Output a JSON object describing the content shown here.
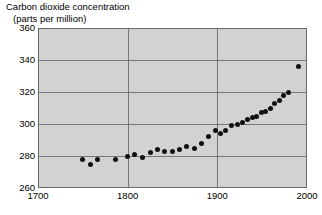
{
  "chart_data": {
    "type": "scatter",
    "title": "Carbon dioxide concentration (parts per million)",
    "title_line1": "Carbon dioxide concentration",
    "title_line2": "(parts per million)",
    "xlabel": "",
    "ylabel": "",
    "xlim": [
      1700,
      2000
    ],
    "ylim": [
      260,
      360
    ],
    "xticks": [
      1700,
      1800,
      1900,
      2000
    ],
    "yticks": [
      260,
      280,
      300,
      320,
      340,
      360
    ],
    "grid": true,
    "legend": "none",
    "marker": "filled-circle",
    "marker_color": "#101010",
    "plot_background": "#d2d2d2",
    "gridline_color": "#767676",
    "x": [
      1750,
      1758,
      1766,
      1786,
      1800,
      1808,
      1816,
      1825,
      1833,
      1841,
      1850,
      1858,
      1866,
      1874,
      1882,
      1890,
      1898,
      1903,
      1909,
      1916,
      1922,
      1928,
      1934,
      1939,
      1944,
      1949,
      1954,
      1959,
      1964,
      1969,
      1974,
      1979,
      1990
    ],
    "y": [
      278,
      275,
      278,
      278,
      280,
      281,
      279,
      282,
      284,
      283,
      283,
      284,
      286,
      285,
      288,
      292,
      296,
      294,
      296,
      299,
      300,
      301,
      303,
      304,
      305,
      307,
      308,
      310,
      313,
      315,
      318,
      320,
      336
    ],
    "points": [
      {
        "year": 1750,
        "ppm": 278
      },
      {
        "year": 1758,
        "ppm": 275
      },
      {
        "year": 1766,
        "ppm": 278
      },
      {
        "year": 1786,
        "ppm": 278
      },
      {
        "year": 1800,
        "ppm": 280
      },
      {
        "year": 1808,
        "ppm": 281
      },
      {
        "year": 1816,
        "ppm": 279
      },
      {
        "year": 1825,
        "ppm": 282
      },
      {
        "year": 1833,
        "ppm": 284
      },
      {
        "year": 1841,
        "ppm": 283
      },
      {
        "year": 1850,
        "ppm": 283
      },
      {
        "year": 1858,
        "ppm": 284
      },
      {
        "year": 1866,
        "ppm": 286
      },
      {
        "year": 1874,
        "ppm": 285
      },
      {
        "year": 1882,
        "ppm": 288
      },
      {
        "year": 1890,
        "ppm": 292
      },
      {
        "year": 1898,
        "ppm": 296
      },
      {
        "year": 1903,
        "ppm": 294
      },
      {
        "year": 1909,
        "ppm": 296
      },
      {
        "year": 1916,
        "ppm": 299
      },
      {
        "year": 1922,
        "ppm": 300
      },
      {
        "year": 1928,
        "ppm": 301
      },
      {
        "year": 1934,
        "ppm": 303
      },
      {
        "year": 1939,
        "ppm": 304
      },
      {
        "year": 1944,
        "ppm": 305
      },
      {
        "year": 1949,
        "ppm": 307
      },
      {
        "year": 1954,
        "ppm": 308
      },
      {
        "year": 1959,
        "ppm": 310
      },
      {
        "year": 1964,
        "ppm": 313
      },
      {
        "year": 1969,
        "ppm": 315
      },
      {
        "year": 1974,
        "ppm": 318
      },
      {
        "year": 1979,
        "ppm": 320
      },
      {
        "year": 1990,
        "ppm": 336
      }
    ]
  }
}
